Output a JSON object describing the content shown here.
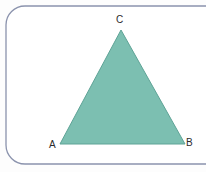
{
  "figure": {
    "kind": "geometry-diagram",
    "background_color": "#fdfdfd",
    "frame": {
      "border_color": "#8b93ad",
      "border_width": 1.3,
      "corner_radius": 19,
      "fill": "#ffffff"
    },
    "triangle": {
      "fill_color": "#7cbfb1",
      "stroke_color": "#5ea396",
      "stroke_width": 1,
      "vertices": [
        {
          "label": "A",
          "x": 60,
          "y": 144
        },
        {
          "label": "B",
          "x": 185,
          "y": 144
        },
        {
          "label": "C",
          "x": 121,
          "y": 30
        }
      ]
    },
    "labels": {
      "a": "A",
      "b": "B",
      "c": "C",
      "color": "#2b2b2b",
      "font_size_px": 10
    }
  }
}
